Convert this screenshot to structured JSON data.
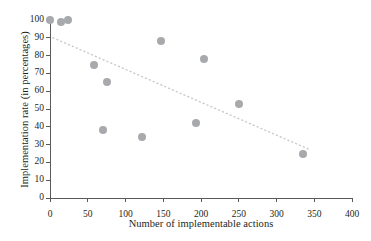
{
  "chart_data": {
    "type": "scatter",
    "title": "",
    "xlabel": "Number of implementable actions",
    "ylabel": "Implementation rate (in percentages)",
    "xlim": [
      0,
      400
    ],
    "ylim": [
      0,
      100
    ],
    "xticks": [
      0,
      50,
      100,
      150,
      200,
      250,
      300,
      350,
      400
    ],
    "yticks": [
      0,
      10,
      20,
      30,
      40,
      50,
      60,
      70,
      80,
      90,
      100
    ],
    "grid": false,
    "legend": null,
    "marker_color": "#a7a9ac",
    "trendline_color": "#c8c9cb",
    "axis_color": "#58595b",
    "points": [
      {
        "x": 0,
        "y": 100
      },
      {
        "x": 15,
        "y": 99
      },
      {
        "x": 24,
        "y": 100
      },
      {
        "x": 58,
        "y": 75
      },
      {
        "x": 76,
        "y": 65
      },
      {
        "x": 70,
        "y": 38
      },
      {
        "x": 122,
        "y": 34
      },
      {
        "x": 147,
        "y": 88
      },
      {
        "x": 194,
        "y": 42
      },
      {
        "x": 204,
        "y": 78
      },
      {
        "x": 250,
        "y": 53
      },
      {
        "x": 335,
        "y": 25
      }
    ],
    "trendline": {
      "style": "dotted",
      "x0": 4,
      "y0": 90,
      "x1": 345,
      "y1": 27
    }
  },
  "axis_labels": {
    "y": [
      "0",
      "10",
      "20",
      "30",
      "40",
      "50",
      "60",
      "70",
      "80",
      "90",
      "100"
    ],
    "x": [
      "0",
      "50",
      "100",
      "150",
      "200",
      "250",
      "300",
      "350",
      "400"
    ]
  }
}
